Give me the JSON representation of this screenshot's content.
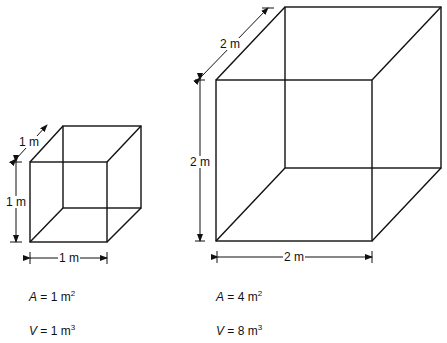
{
  "small_cube": {
    "depth_label": "1 m",
    "height_label": "1 m",
    "width_label": "1 m",
    "area": {
      "var": "A",
      "eq": " = 1 m",
      "exp": "2"
    },
    "volume": {
      "var": "V",
      "eq": " = 1 m",
      "exp": "3"
    }
  },
  "large_cube": {
    "depth_label": "2 m",
    "height_label": "2 m",
    "width_label": "2 m",
    "area": {
      "var": "A",
      "eq": " = 4 m",
      "exp": "2"
    },
    "volume": {
      "var": "V",
      "eq": " = 8 m",
      "exp": "3"
    }
  },
  "colors": {
    "line": "#111111",
    "background": "#ffffff"
  }
}
